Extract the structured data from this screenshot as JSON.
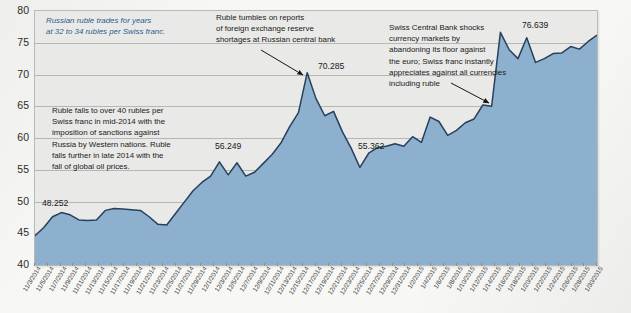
{
  "chart_data": {
    "type": "area",
    "title": "",
    "subtitle": "",
    "xlabel": "",
    "ylabel": "",
    "ylim": [
      40,
      80
    ],
    "yticks": [
      40,
      45,
      50,
      55,
      60,
      65,
      70,
      75,
      80
    ],
    "grid": true,
    "legend_position": "none",
    "series_name": "Russian rubles per Swiss franc",
    "x": [
      "11/3/2014",
      "11/5/2014",
      "11/7/2014",
      "11/9/2014",
      "11/11/2014",
      "11/13/2014",
      "11/15/2014",
      "11/17/2014",
      "11/19/2014",
      "11/21/2014",
      "11/23/2014",
      "11/25/2014",
      "11/27/2014",
      "11/29/2014",
      "12/1/2014",
      "12/3/2014",
      "12/5/2014",
      "12/7/2014",
      "12/9/2014",
      "12/11/2014",
      "12/13/2014",
      "12/15/2014",
      "12/17/2014",
      "12/19/2014",
      "12/21/2014",
      "12/23/2014",
      "12/25/2014",
      "12/27/2014",
      "12/29/2014",
      "12/31/2014",
      "1/2/2015",
      "1/4/2015",
      "1/6/2015",
      "1/8/2015",
      "1/10/2015",
      "1/12/2015",
      "1/14/2015",
      "1/16/2015",
      "1/18/2015",
      "1/20/2015",
      "1/22/2015",
      "1/24/2015",
      "1/26/2015",
      "1/28/2015",
      "1/30/2015"
    ],
    "values": [
      44.6,
      45.9,
      47.6,
      48.252,
      47.9,
      47.1,
      47.0,
      47.1,
      48.6,
      48.9,
      48.8,
      48.7,
      48.6,
      47.6,
      46.4,
      46.3,
      48.1,
      49.9,
      51.7,
      53.0,
      54.0,
      56.249,
      54.2,
      56.1,
      54.0,
      54.6,
      56.0,
      57.4,
      59.2,
      61.8,
      64.0,
      70.285,
      66.2,
      63.5,
      64.2,
      61.0,
      58.4,
      55.362,
      57.6,
      58.5,
      58.7,
      59.1,
      58.7,
      60.2,
      59.3
    ],
    "values_tail": [
      63.3,
      62.6,
      60.4,
      61.2,
      62.4,
      63.0,
      65.2,
      65.0,
      76.639,
      73.9,
      72.5,
      75.8,
      71.9,
      72.5,
      73.3,
      73.4,
      74.4,
      74.0,
      75.2,
      76.2
    ],
    "labeled_points": [
      {
        "label": "48.252",
        "value": 48.252,
        "date": "11/9/2014"
      },
      {
        "label": "56.249",
        "value": 56.249,
        "date": "12/15/2014"
      },
      {
        "label": "70.285",
        "value": 70.285,
        "date": "12/16/2014"
      },
      {
        "label": "55.362",
        "value": 55.362,
        "date": "1/1/2015"
      },
      {
        "label": "76.639",
        "value": 76.639,
        "date": "1/15/2015"
      }
    ],
    "annotations": [
      {
        "id": "annotation-stable-rate",
        "text": "Russian ruble trades for years\nat 32 to 34 rubles per Swiss franc.",
        "style": "italic-blue",
        "has_arrow": false
      },
      {
        "id": "annotation-sanctions",
        "text": "Ruble falls to over 40 rubles per\nSwiss franc in mid-2014 with the\nimposition of sanctions against\nRussia by Western nations. Ruble\nfalls further in late 2014 with the\nfall of global oil prices.",
        "style": "plain",
        "has_arrow": false
      },
      {
        "id": "annotation-reserve-shortage",
        "text": "Ruble tumbles on reports\nof foreign exchange reserve\nshortages at Russian central bank",
        "style": "plain",
        "has_arrow": true
      },
      {
        "id": "annotation-swiss-central-bank",
        "text": "Swiss Central Bank shocks\ncurrency markets by\nabandoning its floor against\nthe euro; Swiss franc instantly\nappreciates against all currencies\nincluding ruble",
        "style": "plain",
        "has_arrow": true
      }
    ],
    "colors": {
      "area_fill": "#8cb0ce",
      "line": "#28405c",
      "plot_background": "#e9e9e7",
      "gridline": "#b6b6b2",
      "annotation_blue": "#2a5d8f",
      "annotation_text": "#1a1a1a",
      "page_background": "#f7f7f5"
    }
  }
}
